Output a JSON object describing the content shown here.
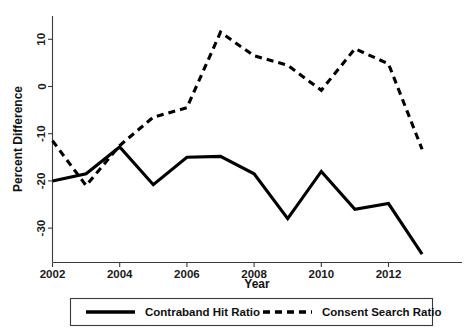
{
  "chart_data": {
    "type": "line",
    "title": "",
    "xlabel": "Year",
    "ylabel": "Percent Difference",
    "x": [
      2002,
      2003,
      2004,
      2005,
      2006,
      2007,
      2008,
      2009,
      2010,
      2011,
      2012,
      2013
    ],
    "xticks": [
      2002,
      2004,
      2006,
      2008,
      2010,
      2012
    ],
    "xtick_labels": [
      "2002",
      "2004",
      "2006",
      "2008",
      "2010",
      "2012"
    ],
    "yticks": [
      10,
      0,
      -10,
      -20,
      -30
    ],
    "ytick_labels": [
      "10",
      "0",
      "-10",
      "-20",
      "-30"
    ],
    "xlim": [
      2002,
      2013
    ],
    "ylim": [
      -36.5,
      12.5
    ],
    "grid": false,
    "legend_position": "bottom",
    "series": [
      {
        "name": "Contraband Hit Ratio",
        "style": "solid",
        "color": "#000000",
        "values": [
          -20.0,
          -18.5,
          -12.8,
          -20.8,
          -15.0,
          -14.8,
          -18.5,
          -28.0,
          -18.0,
          -26.0,
          -24.8,
          -35.5
        ]
      },
      {
        "name": "Consent Search Ratio",
        "style": "dashed",
        "color": "#000000",
        "values": [
          -11.5,
          -21.0,
          -12.5,
          -6.5,
          -4.5,
          11.5,
          6.5,
          4.5,
          -0.8,
          8.0,
          4.8,
          -13.3
        ]
      }
    ]
  },
  "legend": {
    "items": [
      {
        "label": "Contraband Hit Ratio",
        "style": "solid"
      },
      {
        "label": "Consent Search Ratio",
        "style": "dashed"
      }
    ]
  }
}
